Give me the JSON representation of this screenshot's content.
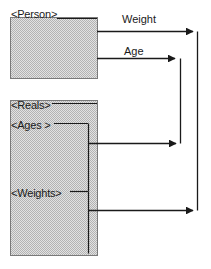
{
  "diagram": {
    "type": "mapping-diagram",
    "background_color": "#ffffff",
    "line_color": "#1a1a1a",
    "box_fill_color": "#d8d8d8",
    "box_border_color": "#6e6e6e",
    "text_color": "#1a1a1a",
    "boxes": [
      {
        "id": "person-box",
        "label": "<Person>",
        "x": 10,
        "y": 17,
        "width": 87,
        "height": 61
      },
      {
        "id": "types-box",
        "label": "",
        "x": 10,
        "y": 100,
        "width": 87,
        "height": 155
      }
    ],
    "node_labels": [
      {
        "id": "person",
        "text": "<Person>",
        "x": 11,
        "y": 8
      },
      {
        "id": "reals",
        "text": "<Reals>",
        "x": 11,
        "y": 99
      },
      {
        "id": "ages",
        "text": "<Ages >",
        "x": 11,
        "y": 119
      },
      {
        "id": "weights",
        "text": "<Weights>",
        "x": 11,
        "y": 187
      }
    ],
    "edge_labels": [
      {
        "id": "weight-edge",
        "text": "Weight",
        "x": 122,
        "y": 13
      },
      {
        "id": "age-edge",
        "text": "Age",
        "x": 124,
        "y": 45
      }
    ],
    "edges": [
      {
        "id": "weight-mapping",
        "from": "person-box",
        "to": "weights-rail",
        "label": "Weight"
      },
      {
        "id": "age-mapping",
        "from": "person-box",
        "to": "ages-rail",
        "label": "Age"
      },
      {
        "id": "ages-mapping",
        "from": "types-box",
        "to": "age-rail",
        "label": ""
      },
      {
        "id": "weights-mapping",
        "from": "types-box",
        "to": "weight-rail",
        "label": ""
      }
    ]
  }
}
